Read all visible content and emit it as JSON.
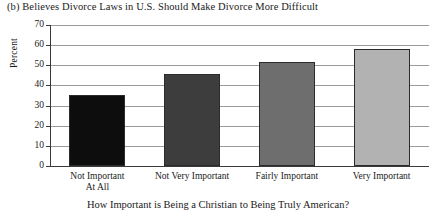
{
  "chart_data": {
    "type": "bar",
    "title": "(b) Believes Divorce Laws in U.S. Should Make Divorce More Difficult",
    "xlabel": "How Important is Being a Christian to Being Truly American?",
    "ylabel": "Percent",
    "categories": [
      "Not Important At All",
      "Not Very Important",
      "Fairly Important",
      "Very Important"
    ],
    "category_lines": [
      [
        "Not Important",
        "At All"
      ],
      [
        "Not Very Important"
      ],
      [
        "Fairly Important"
      ],
      [
        "Very Important"
      ]
    ],
    "values": [
      35.5,
      45.5,
      51.5,
      58
    ],
    "bar_colors": [
      "#0d0d0d",
      "#3d3d3d",
      "#6e6e6e",
      "#b2b2b2"
    ],
    "ylim": [
      0,
      70
    ],
    "ytick_values": [
      0,
      10,
      20,
      30,
      40,
      50,
      60,
      70
    ],
    "ytick_labels": [
      "0",
      "10",
      "20",
      "30",
      "40",
      "50",
      "60",
      "70"
    ],
    "grid": true,
    "legend": false
  }
}
